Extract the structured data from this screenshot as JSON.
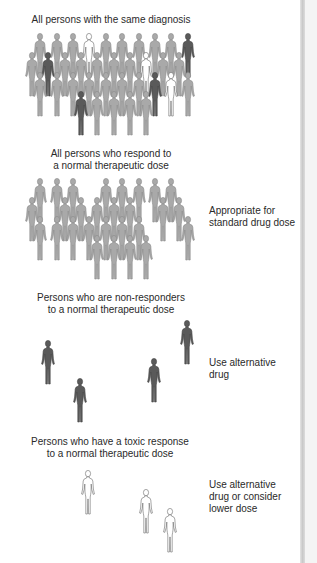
{
  "figure": {
    "sections": [
      {
        "caption_lines": [
          "All persons with the same diagnosis"
        ],
        "note_lines": []
      },
      {
        "caption_lines": [
          "All persons who respond to",
          "a normal therapeutic dose"
        ],
        "note_lines": [
          "Appropriate for",
          "standard drug dose"
        ]
      },
      {
        "caption_lines": [
          "Persons who are non-responders",
          "to a normal therapeutic dose"
        ],
        "note_lines": [
          "Use alternative",
          "drug"
        ]
      },
      {
        "caption_lines": [
          "Persons who have a toxic response",
          "to a normal therapeutic dose"
        ],
        "note_lines": [
          "Use alternative",
          "drug or consider",
          "lower dose"
        ]
      }
    ],
    "colors": {
      "responder": "#a9a9a9",
      "non_responder": "#5a5a5a",
      "toxic": "#ffffff",
      "outline": "#8a8a8a"
    },
    "icons": {
      "person": "person-silhouette-icon"
    }
  }
}
